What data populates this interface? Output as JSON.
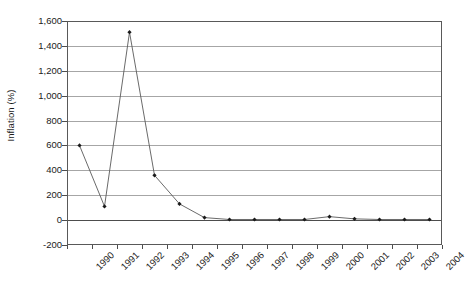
{
  "chart_data": {
    "type": "line",
    "title": "",
    "xlabel": "",
    "ylabel": "Inflation (%)",
    "categories": [
      "1990",
      "1991",
      "1992",
      "1993",
      "1994",
      "1995",
      "1996",
      "1997",
      "1998",
      "1999",
      "2000",
      "2001",
      "2002",
      "2003",
      "2004"
    ],
    "values": [
      600,
      110,
      1510,
      360,
      130,
      20,
      5,
      5,
      5,
      5,
      28,
      10,
      5,
      5,
      5
    ],
    "ylim": [
      -200,
      1600
    ],
    "ytick_step": 200,
    "ytick_labels": [
      "1,600",
      "1,400",
      "1,200",
      "1,000",
      "800",
      "600",
      "400",
      "200",
      "0",
      "-200"
    ],
    "ytick_values": [
      1600,
      1400,
      1200,
      1000,
      800,
      600,
      400,
      200,
      0,
      -200
    ],
    "grid": true,
    "legend": false,
    "legend_position": "none",
    "marker": "diamond",
    "series": [
      {
        "name": "Inflation (%)",
        "values": [
          600,
          110,
          1510,
          360,
          130,
          20,
          5,
          5,
          5,
          5,
          28,
          10,
          5,
          5,
          5
        ]
      }
    ],
    "colors": {
      "line": "#595959",
      "marker": "#1a1a1a",
      "grid": "#a6a6a6",
      "axis": "#595959",
      "zero_line": "#4d4d4d",
      "background": "#ffffff"
    }
  }
}
